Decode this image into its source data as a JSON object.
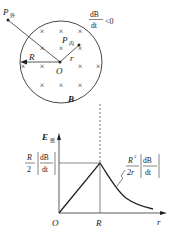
{
  "diagram": {
    "field_region": {
      "point_outside_label": "P",
      "point_outside_subscript": "外",
      "point_inside_label": "P",
      "point_inside_subscript": "内",
      "center_label": "O",
      "radius_label": "R",
      "r_label": "r",
      "field_label": "B",
      "cross_mark": "×",
      "rate_numerator": "dB",
      "rate_denominator": "dt",
      "rate_condition": "<0"
    },
    "graph": {
      "y_axis_label": "E",
      "y_axis_subscript": "感",
      "x_axis_label": "r",
      "origin_label": "O",
      "x_tick_label": "R",
      "peak_label": {
        "numerator": "R",
        "denominator": "2",
        "abs_numerator": "dB",
        "abs_denominator": "dt"
      },
      "curve_label": {
        "numerator": "R",
        "exponent": "2",
        "denominator": "2r",
        "abs_numerator": "dB",
        "abs_denominator": "dt"
      }
    }
  }
}
